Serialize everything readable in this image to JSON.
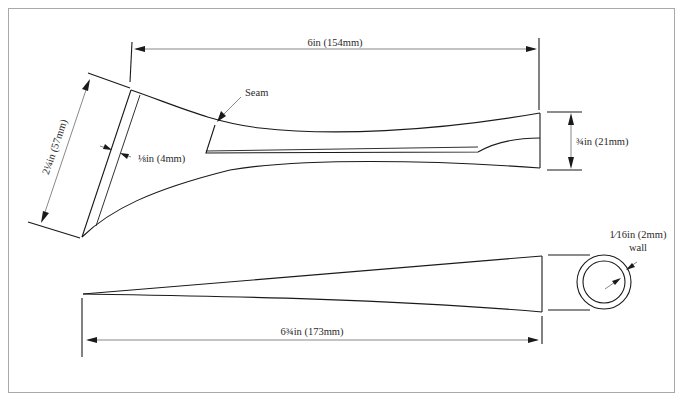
{
  "diagram": {
    "type": "technical-drawing",
    "colors": {
      "line": "#1a1a1a",
      "dimension_line": "#555555",
      "frame": "#a8a8a8",
      "background": "#ffffff"
    },
    "top_view": {
      "length_label": "6in (154mm)",
      "mouth_diameter_label": "2¼in (57mm)",
      "rim_width_label": "⅛in (4mm)",
      "seam_label": "Seam",
      "end_diameter_label": "¾in (21mm)"
    },
    "bottom_view": {
      "length_label": "6¾in (173mm)"
    },
    "cross_section": {
      "wall_label_line1": "1⁄16in (2mm)",
      "wall_label_line2": "wall"
    }
  }
}
